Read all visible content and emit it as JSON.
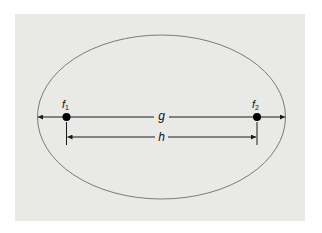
{
  "diagram": {
    "type": "ellipse-foci",
    "colors": {
      "page_background": "#ffffff",
      "panel_background": "#e9e9e8",
      "ellipse_stroke": "#7a7a7a",
      "line": "#1a1a1a",
      "focus_dot": "#000000"
    },
    "labels": {
      "focus1_main": "f",
      "focus1_sub": "1",
      "focus2_main": "f",
      "focus2_sub": "2",
      "major_axis": "g",
      "focal_distance": "h"
    }
  }
}
